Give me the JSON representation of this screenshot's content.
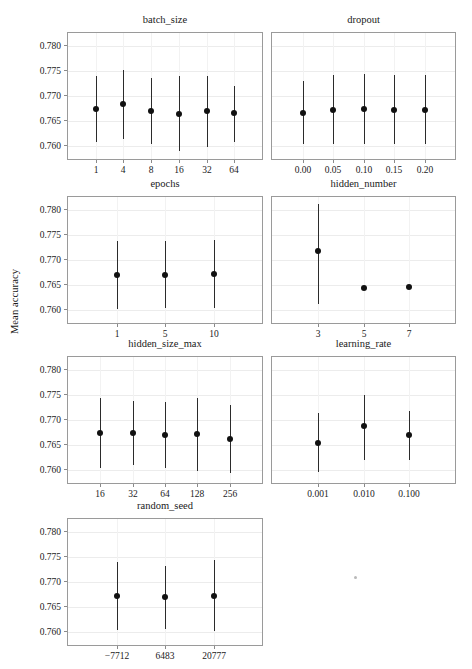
{
  "chart_data": {
    "type": "scatter",
    "title": "",
    "ylabel": "Mean accuracy",
    "xlabel": "",
    "ylim": [
      0.7575,
      0.7825
    ],
    "yticks": [
      0.76,
      0.765,
      0.77,
      0.775,
      0.78
    ],
    "ytick_labels": [
      "0.760",
      "0.765",
      "0.770",
      "0.775",
      "0.780"
    ],
    "grid": true,
    "legend": false,
    "error_bars": "vertical",
    "marker": "filled-circle",
    "panels": [
      {
        "title": "batch_size",
        "xlabel": "batch_size",
        "categories": [
          "1",
          "4",
          "8",
          "16",
          "32",
          "64"
        ],
        "values": [
          0.76735,
          0.76843,
          0.767,
          0.7664,
          0.76697,
          0.76655
        ],
        "err_low": [
          0.7609,
          0.76155,
          0.7605,
          0.75905,
          0.75995,
          0.76085
        ],
        "err_high": [
          0.7739,
          0.7751,
          0.77355,
          0.7739,
          0.77395,
          0.77205
        ]
      },
      {
        "title": "dropout",
        "xlabel": "dropout",
        "categories": [
          "0.00",
          "0.05",
          "0.10",
          "0.15",
          "0.20"
        ],
        "values": [
          0.7667,
          0.7673,
          0.7674,
          0.76725,
          0.76725
        ],
        "err_low": [
          0.7604,
          0.76045,
          0.76045,
          0.76045,
          0.7604
        ],
        "err_high": [
          0.7729,
          0.7742,
          0.7743,
          0.7742,
          0.7741
        ]
      },
      {
        "title": "epochs",
        "xlabel": "epochs",
        "categories": [
          "1",
          "5",
          "10"
        ],
        "values": [
          0.76705,
          0.76705,
          0.76715
        ],
        "err_low": [
          0.76035,
          0.7604,
          0.7604
        ],
        "err_high": [
          0.7738,
          0.77385,
          0.7739
        ]
      },
      {
        "title": "hidden_number",
        "xlabel": "hidden_number",
        "categories": [
          "3",
          "5",
          "7"
        ],
        "values": [
          0.77185,
          0.7645,
          0.76465
        ],
        "err_low": [
          0.7613,
          0.7642,
          0.76465
        ],
        "err_high": [
          0.78105,
          0.76485,
          0.76465
        ]
      },
      {
        "title": "hidden_size_max",
        "xlabel": "hidden_size_max",
        "categories": [
          "16",
          "32",
          "64",
          "128",
          "256"
        ],
        "values": [
          0.7675,
          0.76735,
          0.767,
          0.7672,
          0.7662
        ],
        "err_low": [
          0.76055,
          0.76105,
          0.7605,
          0.75995,
          0.75945
        ],
        "err_high": [
          0.7744,
          0.77385,
          0.77355,
          0.7744,
          0.773
        ]
      },
      {
        "title": "learning_rate",
        "xlabel": "learning_rate",
        "categories": [
          "0.001",
          "0.010",
          "0.100"
        ],
        "values": [
          0.7655,
          0.7689,
          0.767
        ],
        "err_low": [
          0.75975,
          0.7621,
          0.76215
        ],
        "err_high": [
          0.77135,
          0.7749,
          0.77185
        ]
      },
      {
        "title": "random_seed",
        "xlabel": "random_seed",
        "categories": [
          "−7712",
          "6483",
          "20777"
        ],
        "values": [
          0.7672,
          0.767,
          0.76725
        ],
        "err_low": [
          0.76045,
          0.7607,
          0.76025
        ],
        "err_high": [
          0.77395,
          0.77325,
          0.7744
        ]
      }
    ]
  },
  "layout": {
    "rows": [
      {
        "top": 14,
        "plot_top": 32,
        "plot_height": 128
      },
      {
        "top": 178,
        "plot_top": 196,
        "plot_height": 128
      },
      {
        "top": 338,
        "plot_top": 356,
        "plot_height": 128
      },
      {
        "top": 500,
        "plot_top": 518,
        "plot_height": 128
      }
    ],
    "columns": [
      {
        "left": 67,
        "width": 196
      },
      {
        "left": 271,
        "width": 185
      }
    ],
    "panel_positions": [
      {
        "row": 0,
        "col": 0
      },
      {
        "row": 0,
        "col": 1
      },
      {
        "row": 1,
        "col": 0
      },
      {
        "row": 1,
        "col": 1
      },
      {
        "row": 2,
        "col": 0
      },
      {
        "row": 2,
        "col": 1
      },
      {
        "row": 3,
        "col": 0
      }
    ]
  }
}
